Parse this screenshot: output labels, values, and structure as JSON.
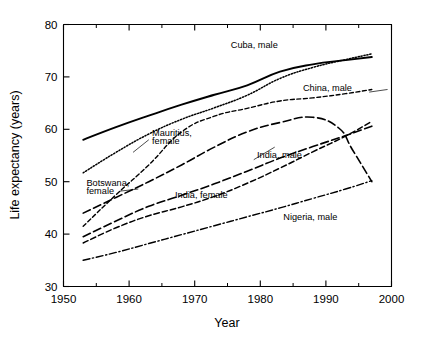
{
  "chart_data": {
    "type": "line",
    "title": "",
    "xlabel": "Year",
    "ylabel": "Life expectancy (years)",
    "xlim": [
      1950,
      2000
    ],
    "ylim": [
      30,
      80
    ],
    "xticks": [
      1950,
      1960,
      1970,
      1980,
      1990,
      2000
    ],
    "xtick_labels": [
      "1950",
      "1960",
      "1970",
      "1980",
      "1990",
      "2000"
    ],
    "xticks_minor": [
      1955,
      1965,
      1975,
      1985,
      1995
    ],
    "yticks": [
      30,
      40,
      50,
      60,
      70,
      80
    ],
    "ytick_labels": [
      "30",
      "40",
      "50",
      "60",
      "70",
      "80"
    ],
    "grid": false,
    "legend_position": "inline-annotations",
    "series": [
      {
        "name": "Cuba, male",
        "style": "solid",
        "label": "Cuba, male",
        "label_x": 1975.5,
        "label_y": 75.6,
        "x": [
          1953,
          1958,
          1963,
          1968,
          1973,
          1978,
          1983,
          1988,
          1993,
          1997
        ],
        "values": [
          58.0,
          60.4,
          62.6,
          64.7,
          66.6,
          68.4,
          71.0,
          72.4,
          73.2,
          73.8
        ]
      },
      {
        "name": "Mauritius, female",
        "style": "dotted",
        "label": "Mauritius, female",
        "label_x": 1963.5,
        "label_y": 58.8,
        "x": [
          1953,
          1958,
          1963,
          1968,
          1973,
          1978,
          1983,
          1988,
          1993,
          1997
        ],
        "values": [
          51.7,
          55.6,
          59.1,
          61.9,
          64.1,
          66.5,
          69.7,
          71.8,
          73.3,
          74.4
        ]
      },
      {
        "name": "China, male",
        "style": "dashed-short",
        "label": "China, male",
        "label_x": 1986.5,
        "label_y": 67.3,
        "x": [
          1953,
          1958,
          1963,
          1968,
          1973,
          1978,
          1983,
          1988,
          1993,
          1997
        ],
        "values": [
          41.5,
          47.5,
          53.2,
          59.5,
          62.5,
          64.0,
          65.4,
          66.0,
          66.8,
          67.6
        ]
      },
      {
        "name": "Botswana, female",
        "style": "dashed-long",
        "label": "Botswana, female",
        "label_x": 1953.5,
        "label_y": 49.2,
        "x": [
          1953,
          1958,
          1963,
          1968,
          1973,
          1978,
          1983,
          1988,
          1992,
          1994,
          1997
        ],
        "values": [
          44.0,
          47.0,
          50.0,
          53.2,
          56.6,
          59.5,
          61.3,
          62.3,
          60.2,
          56.2,
          50.0
        ]
      },
      {
        "name": "India, male",
        "style": "dashed-long",
        "label": "India, male",
        "label_x": 1979.5,
        "label_y": 54.6,
        "x": [
          1953,
          1958,
          1963,
          1968,
          1973,
          1978,
          1983,
          1988,
          1993,
          1997
        ],
        "values": [
          39.5,
          42.5,
          45.3,
          47.4,
          49.6,
          52.0,
          54.5,
          56.7,
          58.8,
          60.6
        ]
      },
      {
        "name": "India, female",
        "style": "dashed-medium",
        "label": "India, female",
        "label_x": 1967.0,
        "label_y": 46.8,
        "x": [
          1953,
          1958,
          1963,
          1968,
          1973,
          1978,
          1983,
          1988,
          1993,
          1997
        ],
        "values": [
          38.3,
          41.2,
          43.5,
          45.2,
          47.2,
          49.7,
          52.6,
          55.7,
          58.7,
          61.5
        ]
      },
      {
        "name": "Nigeria, male",
        "style": "dash-dot",
        "label": "Nigeria, male",
        "label_x": 1983.5,
        "label_y": 42.6,
        "x": [
          1953,
          1958,
          1963,
          1968,
          1973,
          1978,
          1983,
          1988,
          1993,
          1997
        ],
        "values": [
          35.0,
          36.5,
          38.2,
          39.9,
          41.6,
          43.3,
          45.0,
          46.8,
          48.6,
          50.2
        ]
      }
    ]
  }
}
